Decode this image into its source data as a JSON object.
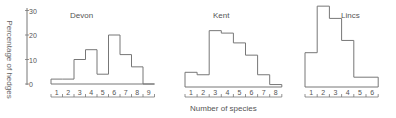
{
  "chart_data": {
    "type": "bar",
    "style": "step-histogram",
    "ylabel": "Percentage of hedges",
    "xlabel": "Number of species",
    "yticks": [
      0,
      10,
      20,
      30
    ],
    "ylim": [
      0,
      34
    ],
    "grid": false,
    "panels": [
      {
        "title": "Devon",
        "categories": [
          "1",
          "2",
          "3",
          "4",
          "5",
          "6",
          "7",
          "8",
          "9"
        ],
        "values": [
          2,
          2,
          10,
          14,
          4,
          20,
          12,
          7,
          0
        ]
      },
      {
        "title": "Kent",
        "categories": [
          "1",
          "2",
          "3",
          "4",
          "5",
          "6",
          "7",
          "8"
        ],
        "values": [
          6,
          5,
          23,
          22,
          18,
          13,
          5,
          1
        ]
      },
      {
        "title": "Lincs",
        "categories": [
          "1",
          "2",
          "3",
          "4",
          "5",
          "6"
        ],
        "values": [
          14,
          33,
          28,
          19,
          4,
          4
        ]
      }
    ]
  },
  "labels": {
    "ylabel": "Percentage of hedges",
    "xlabel": "Number of species",
    "panel_titles": [
      "Devon",
      "Kent",
      "Lincs"
    ]
  },
  "colors": {
    "line": "#777777",
    "text": "#555555"
  }
}
